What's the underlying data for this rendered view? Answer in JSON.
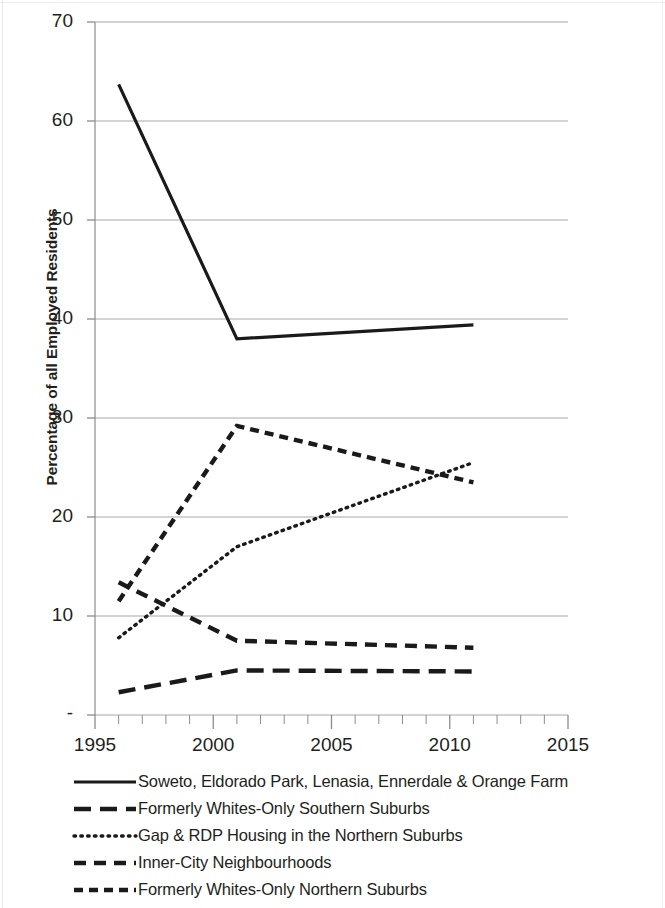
{
  "chart_data": {
    "type": "line",
    "title": "",
    "subtitle": "",
    "xlabel": "",
    "ylabel": "Percentage of all Employed Residents",
    "xlim": [
      1995,
      2015
    ],
    "ylim": [
      0,
      70
    ],
    "grid": true,
    "legend_position": "bottom",
    "x_ticks": [
      "1995",
      "2000",
      "2005",
      "2010",
      "2015"
    ],
    "x_tick_values": [
      1995,
      2000,
      2005,
      2010,
      2015
    ],
    "y_ticks": [
      "-",
      "10",
      "20",
      "30",
      "40",
      "50",
      "60",
      "70"
    ],
    "y_tick_values": [
      0,
      10,
      20,
      30,
      40,
      50,
      60,
      70
    ],
    "x": [
      1996,
      2001,
      2011
    ],
    "series": [
      {
        "name": "Soweto, Eldorado Park, Lenasia, Ennerdale & Orange Farm",
        "style": "solid",
        "color": "#1a1a1a",
        "x": [
          1996,
          2001,
          2011
        ],
        "values": [
          63.7,
          38.0,
          39.4
        ]
      },
      {
        "name": "Formerly Whites-Only Southern Suburbs",
        "style": "long-dash",
        "color": "#1a1a1a",
        "x": [
          1996,
          2001,
          2011
        ],
        "values": [
          2.3,
          4.5,
          4.4
        ]
      },
      {
        "name": "Gap & RDP Housing in the Northern Suburbs",
        "style": "dotted",
        "color": "#1a1a1a",
        "x": [
          1996,
          2001,
          2011
        ],
        "values": [
          7.8,
          17.0,
          25.5
        ]
      },
      {
        "name": "Inner-City Neighbourhoods",
        "style": "medium-dash",
        "color": "#1a1a1a",
        "x": [
          1996,
          2001,
          2011
        ],
        "values": [
          13.4,
          7.5,
          6.8
        ]
      },
      {
        "name": "Formerly Whites-Only Northern Suburbs",
        "style": "short-dash",
        "color": "#1a1a1a",
        "x": [
          1996,
          2001,
          2011
        ],
        "values": [
          11.5,
          29.2,
          23.5
        ]
      }
    ]
  },
  "axis": {
    "y_title": "Percentage of all Employed Residents",
    "y_labels": [
      "70",
      "60",
      "50",
      "40",
      "30",
      "20",
      "10",
      "-"
    ],
    "x_labels": [
      "1995",
      "2000",
      "2005",
      "2010",
      "2015"
    ]
  },
  "legend": {
    "items": [
      {
        "label": "Soweto, Eldorado Park, Lenasia, Ennerdale & Orange Farm",
        "style": "solid"
      },
      {
        "label": "Formerly Whites-Only Southern Suburbs",
        "style": "long-dash"
      },
      {
        "label": "Gap & RDP Housing in the Northern Suburbs",
        "style": "dotted"
      },
      {
        "label": "Inner-City Neighbourhoods",
        "style": "medium-dash"
      },
      {
        "label": "Formerly Whites-Only Northern Suburbs",
        "style": "short-dash"
      }
    ]
  },
  "colors": {
    "ink": "#1a1a1a",
    "grid": "#a8a8a8",
    "axis": "#8c8c8c",
    "background": "#ffffff"
  }
}
